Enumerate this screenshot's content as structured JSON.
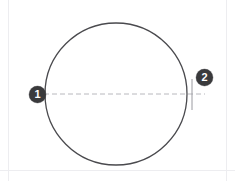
{
  "figure": {
    "background_color": "#ffffff",
    "width": 235,
    "height": 181
  },
  "shapes": {
    "circle": {
      "name": "outline-circle",
      "center_x": 116,
      "center_y": 94,
      "radius": 71,
      "stroke_color": "#4a4a4e",
      "stroke_width": 1.3,
      "fill": "none"
    },
    "centerline": {
      "name": "horizontal-dashed-centerline",
      "x1": 44,
      "y1": 94,
      "x2": 205,
      "y2": 94,
      "stroke_color": "#b8b8bd",
      "stroke_width": 1,
      "dash_pattern": "5 3"
    },
    "tick": {
      "name": "vertical-tick-mark",
      "x": 192,
      "y1": 79,
      "y2": 110,
      "stroke_color": "#9a9aa0",
      "stroke_width": 1
    }
  },
  "callouts": [
    {
      "id": "callout-1",
      "label": "1",
      "x": 38,
      "y": 95,
      "fill_color": "#3a3a3c",
      "text_color": "#ffffff"
    },
    {
      "id": "callout-2",
      "label": "2",
      "x": 205,
      "y": 78,
      "fill_color": "#3a3a3c",
      "text_color": "#ffffff"
    }
  ],
  "frame": {
    "rule_color": "#ededf0",
    "left_rule_x": 8,
    "right_rule_x": 226,
    "bottom_rule_y": 170
  }
}
